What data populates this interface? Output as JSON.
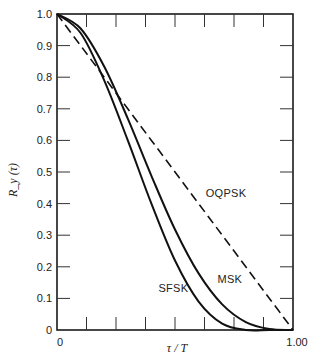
{
  "chart_data": {
    "type": "line",
    "title": "",
    "xlabel": "τ / T",
    "ylabel": "R_y (τ)",
    "xlim": [
      0,
      1.0
    ],
    "ylim": [
      0,
      1.0
    ],
    "grid": false,
    "legend": "inline labels on curves",
    "x_tick_labels": [
      "0",
      "1.00"
    ],
    "x_minor_ticks": 8,
    "y_ticks": [
      0,
      0.1,
      0.2,
      0.3,
      0.4,
      0.5,
      0.6,
      0.7,
      0.8,
      0.9,
      1.0
    ],
    "y_tick_labels": [
      "0",
      "0.1",
      "0.2",
      "0.3",
      "0.4",
      "0.5",
      "0.6",
      "0.7",
      "0.8",
      "0.9",
      "1.0"
    ],
    "x": [
      0,
      0.1,
      0.2,
      0.3,
      0.4,
      0.5,
      0.6,
      0.7,
      0.8,
      0.9,
      1.0
    ],
    "series": [
      {
        "name": "OQPSK",
        "style": "dashed",
        "values": [
          1.0,
          0.9,
          0.8,
          0.7,
          0.6,
          0.5,
          0.4,
          0.3,
          0.2,
          0.1,
          0.0
        ]
      },
      {
        "name": "MSK",
        "style": "solid",
        "values": [
          1.0,
          0.954,
          0.834,
          0.669,
          0.488,
          0.318,
          0.179,
          0.081,
          0.025,
          0.003,
          0.0
        ]
      },
      {
        "name": "SFSK",
        "style": "solid",
        "values": [
          1.0,
          0.94,
          0.79,
          0.6,
          0.4,
          0.22,
          0.09,
          0.02,
          0.0,
          0.0,
          0.0
        ]
      }
    ],
    "annotations": [
      {
        "text": "OQPSK",
        "x": 0.63,
        "y": 0.42
      },
      {
        "text": "MSK",
        "x": 0.68,
        "y": 0.15
      },
      {
        "text": "SFSK",
        "x": 0.43,
        "y": 0.12
      }
    ]
  }
}
